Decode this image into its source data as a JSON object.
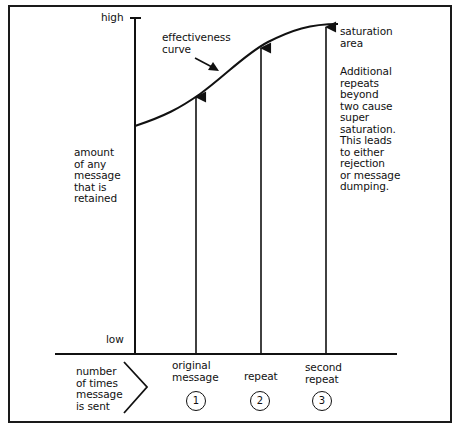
{
  "diagram": {
    "y_axis": {
      "high_label": "high",
      "low_label": "low",
      "title": "amount\nof any\nmessage\nthat is\nretained"
    },
    "x_axis": {
      "title": "number\nof times\nmessage\nis sent",
      "items": [
        {
          "label": "original\nmessage",
          "number": "1"
        },
        {
          "label": "repeat",
          "number": "2"
        },
        {
          "label": "second\nrepeat",
          "number": "3"
        }
      ]
    },
    "curve_label": "effectiveness\ncurve",
    "saturation_label": "saturation\narea",
    "note": "Additional\nrepeats\nbeyond\ntwo cause\nsuper\nsaturation.\nThis leads\nto either\nrejection\nor message\ndumping."
  },
  "colors": {
    "ink": "#111111",
    "background": "#ffffff"
  }
}
